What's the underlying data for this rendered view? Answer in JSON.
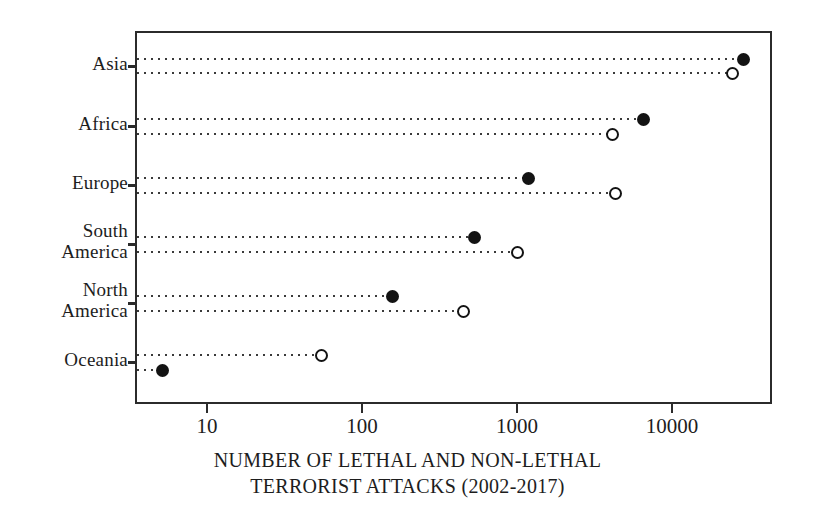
{
  "chart_data": {
    "type": "scatter",
    "title": "",
    "xlabel": "NUMBER OF LETHAL AND NON-LETHAL TERRORIST ATTACKS (2002-2017)",
    "xlabel_lines": [
      "NUMBER OF LETHAL AND NON-LETHAL",
      "TERRORIST ATTACKS (2002-2017)"
    ],
    "ylabel": "",
    "xscale": "log",
    "xlim": [
      3.4,
      75000
    ],
    "grid": false,
    "legend": null,
    "xticks": [
      10,
      100,
      1000,
      10000
    ],
    "xticklabels": [
      "10",
      "100",
      "1000",
      "10000"
    ],
    "categories": [
      "Asia",
      "Africa",
      "Europe",
      "South\nAmerica",
      "North\nAmerica",
      "Oceania"
    ],
    "series": [
      {
        "name": "lethal",
        "marker": "filled-circle",
        "color": "#131313",
        "values": [
          29000,
          6500,
          1180,
          535,
          158,
          5.2
        ]
      },
      {
        "name": "non-lethal",
        "marker": "open-circle",
        "color": "#131313",
        "values": [
          24500,
          4150,
          4300,
          1000,
          450,
          55
        ]
      }
    ],
    "points": [
      {
        "category": "Asia",
        "series": "lethal",
        "value": 29000,
        "marker": "filled-circle"
      },
      {
        "category": "Asia",
        "series": "non-lethal",
        "value": 24500,
        "marker": "open-circle"
      },
      {
        "category": "Africa",
        "series": "lethal",
        "value": 6500,
        "marker": "filled-circle"
      },
      {
        "category": "Africa",
        "series": "non-lethal",
        "value": 4150,
        "marker": "open-circle"
      },
      {
        "category": "Europe",
        "series": "lethal",
        "value": 1180,
        "marker": "filled-circle"
      },
      {
        "category": "Europe",
        "series": "non-lethal",
        "value": 4300,
        "marker": "open-circle"
      },
      {
        "category": "South America",
        "series": "lethal",
        "value": 535,
        "marker": "filled-circle"
      },
      {
        "category": "South America",
        "series": "non-lethal",
        "value": 1000,
        "marker": "open-circle"
      },
      {
        "category": "North America",
        "series": "lethal",
        "value": 158,
        "marker": "filled-circle"
      },
      {
        "category": "North America",
        "series": "non-lethal",
        "value": 450,
        "marker": "open-circle"
      },
      {
        "category": "Oceania",
        "series": "non-lethal",
        "value": 55,
        "marker": "open-circle"
      },
      {
        "category": "Oceania",
        "series": "lethal",
        "value": 5.2,
        "marker": "filled-circle"
      }
    ]
  },
  "axis": {
    "ytick_labels": [
      "Asia",
      "Africa",
      "Europe",
      "South\nAmerica",
      "North\nAmerica",
      "Oceania"
    ],
    "xtick_labels": [
      "10",
      "100",
      "1000",
      "10000"
    ],
    "xtitle_line1": "NUMBER OF LETHAL AND NON-LETHAL",
    "xtitle_line2": "TERRORIST ATTACKS (2002-2017)"
  },
  "colors": {
    "frame": "#2b2b2b",
    "marker": "#131313",
    "dotted_line": "#3a3a3a",
    "background": "#ffffff"
  }
}
